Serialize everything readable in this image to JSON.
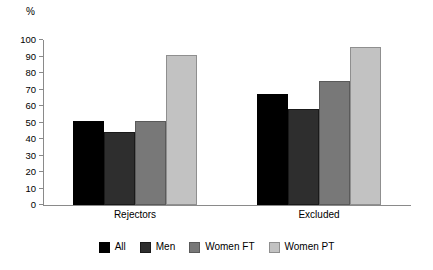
{
  "chart_data": {
    "type": "bar",
    "title": "",
    "subtitle": "",
    "xlabel": "",
    "ylabel": "%",
    "categories": [
      "Rejectors",
      "Excluded"
    ],
    "series": [
      {
        "name": "All",
        "color": "#000000",
        "values": [
          51,
          67
        ]
      },
      {
        "name": "Men",
        "color": "#2e2e2e",
        "values": [
          44,
          58
        ]
      },
      {
        "name": "Women FT",
        "color": "#787878",
        "values": [
          51,
          75
        ]
      },
      {
        "name": "Women PT",
        "color": "#c2c2c2",
        "values": [
          91,
          96
        ]
      }
    ],
    "ylim": [
      0,
      100
    ],
    "yticks": [
      0,
      10,
      20,
      30,
      40,
      50,
      60,
      70,
      80,
      90,
      100
    ],
    "ytick_labels": [
      "0",
      "10",
      "20",
      "30",
      "40",
      "50",
      "60",
      "70",
      "80",
      "90",
      "100"
    ],
    "grid": false,
    "legend_position": "bottom",
    "axis_color": "#8a8a8a"
  }
}
